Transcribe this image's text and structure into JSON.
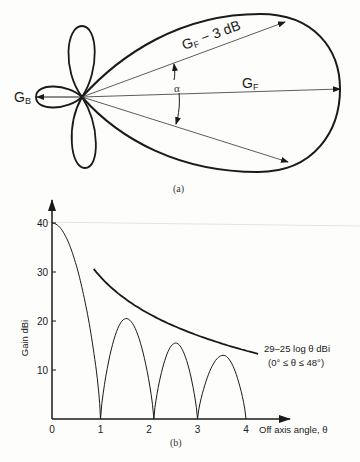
{
  "polar_diagram": {
    "caption": "(a)",
    "labels": {
      "back_gain": "G",
      "back_gain_sub": "B",
      "forward_gain": "G",
      "forward_gain_sub": "F",
      "half_power": "G",
      "half_power_sub": "F",
      "half_power_suffix": " − 3 dB",
      "beamwidth": "α"
    }
  },
  "chart_data": {
    "type": "line",
    "caption": "(b)",
    "title": "",
    "xlabel": "Off axis angle, θ",
    "ylabel": "Gain dBi",
    "xlim": [
      0,
      4.9
    ],
    "ylim": [
      0,
      44
    ],
    "xticks": [
      0,
      1,
      2,
      3,
      4
    ],
    "yticks": [
      10,
      20,
      30,
      40
    ],
    "grid": false,
    "series": [
      {
        "name": "antenna pattern",
        "main_lobe": {
          "x_start": 0,
          "x_end": 1.0,
          "peak": 40
        },
        "sidelobes": [
          {
            "x_start": 1.0,
            "x_end": 2.1,
            "peak_x": 1.53,
            "peak": 20.5
          },
          {
            "x_start": 2.1,
            "x_end": 3.0,
            "peak_x": 2.55,
            "peak": 15.5
          },
          {
            "x_start": 3.0,
            "x_end": 4.0,
            "peak_x": 3.53,
            "peak": 13
          }
        ]
      },
      {
        "name": "envelope",
        "formula": "29 - 25 log θ",
        "x_start": 0.86,
        "x_end": 4.25
      }
    ],
    "annotations": [
      {
        "text": "29–25 log θ dBi"
      },
      {
        "text": "(0° ≤ θ ≤ 48°)"
      }
    ]
  }
}
